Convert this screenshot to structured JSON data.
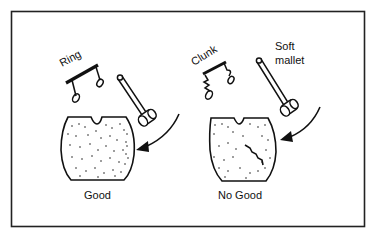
{
  "figure": {
    "left_panel": {
      "sound_label": "Ring",
      "caption": "Good"
    },
    "right_panel": {
      "sound_label": "Clunk",
      "tool_label_line1": "Soft",
      "tool_label_line2": "mallet",
      "caption": "No Good"
    },
    "colors": {
      "ink": "#111111",
      "background": "#ffffff"
    }
  }
}
